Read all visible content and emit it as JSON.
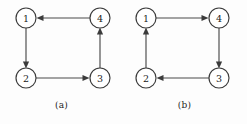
{
  "figure": {
    "background_color": "#fdfdfd",
    "stroke_color": "#4a4a4a",
    "node_fill_color": "#ffffff",
    "text_color": "#1c1c1c",
    "diagrams": [
      {
        "id": "a",
        "caption": "(a)",
        "nodes": [
          {
            "label": "1",
            "cx": 26,
            "cy": 18,
            "r": 10
          },
          {
            "label": "4",
            "cx": 100,
            "cy": 18,
            "r": 10
          },
          {
            "label": "2",
            "cx": 26,
            "cy": 78,
            "r": 10
          },
          {
            "label": "3",
            "cx": 100,
            "cy": 78,
            "r": 10
          }
        ],
        "edges": [
          {
            "from": "4",
            "to": "1",
            "direction": "left"
          },
          {
            "from": "1",
            "to": "2",
            "direction": "down"
          },
          {
            "from": "2",
            "to": "3",
            "direction": "right"
          },
          {
            "from": "3",
            "to": "4",
            "direction": "up"
          }
        ]
      },
      {
        "id": "b",
        "caption": "(b)",
        "nodes": [
          {
            "label": "1",
            "cx": 23,
            "cy": 18,
            "r": 10
          },
          {
            "label": "4",
            "cx": 96,
            "cy": 18,
            "r": 10
          },
          {
            "label": "2",
            "cx": 23,
            "cy": 78,
            "r": 10
          },
          {
            "label": "3",
            "cx": 96,
            "cy": 78,
            "r": 10
          }
        ],
        "edges": [
          {
            "from": "1",
            "to": "4",
            "direction": "right"
          },
          {
            "from": "2",
            "to": "1",
            "direction": "up"
          },
          {
            "from": "3",
            "to": "2",
            "direction": "left"
          },
          {
            "from": "4",
            "to": "3",
            "direction": "down"
          }
        ]
      }
    ]
  }
}
